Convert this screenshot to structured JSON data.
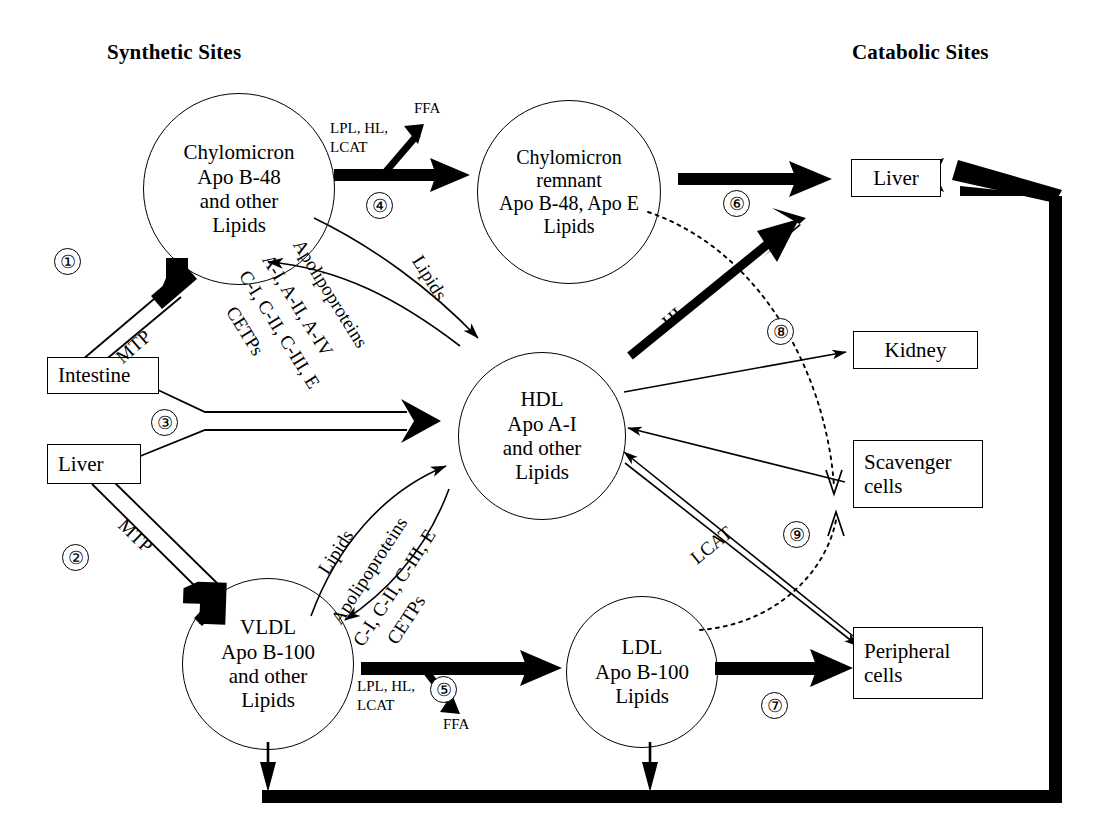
{
  "headers": {
    "left": "Synthetic Sites",
    "right": "Catabolic Sites"
  },
  "nodes": {
    "chylomicron": [
      "Chylomicron",
      "Apo B-48",
      "and other",
      "Lipids"
    ],
    "chylomicron_remnant": [
      "Chylomicron",
      "remnant",
      "Apo B-48, Apo E",
      "Lipids"
    ],
    "hdl": [
      "HDL",
      "Apo A-I",
      "and other",
      "Lipids"
    ],
    "vldl": [
      "VLDL",
      "Apo B-100",
      "and other",
      "Lipids"
    ],
    "ldl": [
      "LDL",
      "Apo B-100",
      "Lipids"
    ],
    "intestine": [
      "Intestine"
    ],
    "liver_left": [
      "Liver"
    ],
    "liver_right": [
      "Liver"
    ],
    "kidney": [
      "Kidney"
    ],
    "scavenger": [
      "Scavenger",
      "cells"
    ],
    "peripheral": [
      "Peripheral",
      "cells"
    ]
  },
  "numbers": {
    "n1": "①",
    "n2": "②",
    "n3": "③",
    "n4": "④",
    "n5": "⑤",
    "n6": "⑥",
    "n7": "⑦",
    "n8": "⑧",
    "n9": "⑨"
  },
  "labels": {
    "mtp_top": "MTP",
    "mtp_bottom": "MTP",
    "enzymes_top_l1": "LPL, HL,",
    "enzymes_top_l2": "LCAT",
    "ffa_top": "FFA",
    "enzymes_bottom_l1": "LPL, HL,",
    "enzymes_bottom_l2": "LCAT",
    "ffa_bottom": "FFA",
    "hl": "HL",
    "lcat": "LCAT"
  },
  "transfer_top": {
    "l1": "Lipids",
    "l2": "Apolipoproteins",
    "l3": "A-I, A-II, A-IV",
    "l4": "C-I, C-II, C-III, E",
    "l5": "CETPs"
  },
  "transfer_bottom": {
    "l1": "Lipids",
    "l2": "Apolipoproteins",
    "l3": "C-I, C-II, C-III, E",
    "l4": "CETPs"
  },
  "colors": {
    "stroke": "#000000",
    "background": "#ffffff"
  }
}
